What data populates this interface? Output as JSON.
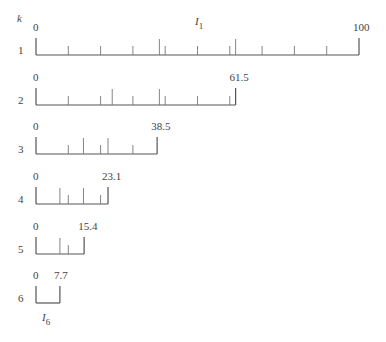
{
  "diagram": {
    "header_label": "k",
    "top_interval_label": "I",
    "top_interval_sub": "1",
    "bottom_interval_label": "I",
    "bottom_interval_sub": "6",
    "scale": {
      "origin_px": 36,
      "px_per_unit": 3.23
    },
    "rows": [
      {
        "k": "1",
        "line_y": 55,
        "start_label": "0",
        "end_label": "100",
        "end": 100,
        "short_ticks": [
          10,
          20,
          30,
          40,
          50,
          60,
          70,
          80,
          90
        ],
        "tall_ticks": [
          38.2,
          61.8
        ]
      },
      {
        "k": "2",
        "line_y": 105,
        "start_label": "0",
        "end_label": "61.5",
        "end": 61.8,
        "short_ticks": [
          10,
          20,
          30,
          40,
          50,
          60
        ],
        "tall_ticks": [
          23.6,
          38.2
        ]
      },
      {
        "k": "3",
        "line_y": 154,
        "start_label": "0",
        "end_label": "38.5",
        "end": 37.5,
        "short_ticks": [
          10,
          20,
          30
        ],
        "tall_ticks": [
          14.7,
          22.3
        ]
      },
      {
        "k": "4",
        "line_y": 204,
        "start_label": "0",
        "end_label": "23.1",
        "end": 22.3,
        "short_ticks": [
          10,
          20
        ],
        "tall_ticks": [
          7.4,
          14.7
        ]
      },
      {
        "k": "5",
        "line_y": 254,
        "start_label": "0",
        "end_label": "15.4",
        "end": 14.9,
        "short_ticks": [
          10
        ],
        "tall_ticks": [
          7.4
        ]
      },
      {
        "k": "6",
        "line_y": 303,
        "start_label": "0",
        "end_label": "7.7",
        "end": 7.4,
        "short_ticks": [],
        "tall_ticks": []
      }
    ]
  }
}
